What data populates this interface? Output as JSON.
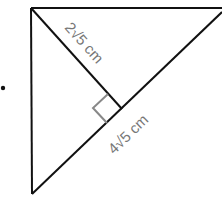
{
  "diagram": {
    "type": "right-triangle-with-altitude",
    "labels": {
      "altitude": "2√5 cm",
      "hypotenuse": "4√5 cm"
    },
    "colors": {
      "lines": "#111111",
      "labels": "#777777",
      "right_angle_marker": "#888888"
    },
    "bullet": "•"
  }
}
